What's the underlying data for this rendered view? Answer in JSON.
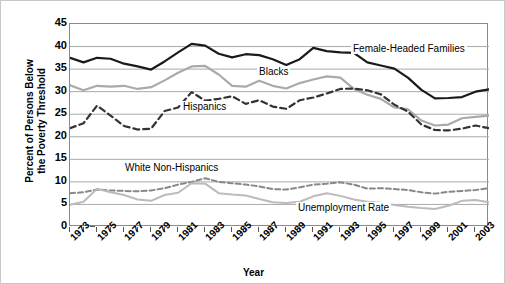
{
  "chart": {
    "type": "line",
    "ylabel_line1": "Percent of Persons Below",
    "ylabel_line2": "the Poverty Threshold",
    "xlabel": "Year"
  },
  "axes": {
    "yticks": [
      "45",
      "40",
      "35",
      "30",
      "25",
      "20",
      "15",
      "10",
      "5",
      "0"
    ],
    "xticks": [
      "1973",
      "1975",
      "1977",
      "1979",
      "1981",
      "1983",
      "1985",
      "1987",
      "1989",
      "1991",
      "1993",
      "1995",
      "1997",
      "1999",
      "2001",
      "2003"
    ]
  },
  "annotations": {
    "female_headed": "Female-Headed Families",
    "blacks": "Blacks",
    "hispanics": "Hispanics",
    "white_non_hispanics": "White Non-Hispanics",
    "unemployment": "Unemployment Rate"
  },
  "colors": {
    "female_headed": "#1a1a1a",
    "blacks": "#aaaaaa",
    "hispanics": "#333333",
    "white_non_hispanics": "#888888",
    "unemployment": "#bbbbbb",
    "grid": "#a9a9a9",
    "frame": "#8a8a8a"
  },
  "chart_data": {
    "type": "line",
    "title": "",
    "xlabel": "Year",
    "ylabel": "Percent of Persons Below the Poverty Threshold",
    "xlim": [
      1973,
      2004
    ],
    "ylim": [
      0,
      45
    ],
    "grid": true,
    "legend": "inline-annotations",
    "x": [
      1973,
      1974,
      1975,
      1976,
      1977,
      1978,
      1979,
      1980,
      1981,
      1982,
      1983,
      1984,
      1985,
      1986,
      1987,
      1988,
      1989,
      1990,
      1991,
      1992,
      1993,
      1994,
      1995,
      1996,
      1997,
      1998,
      1999,
      2000,
      2001,
      2002,
      2003,
      2004
    ],
    "series": [
      {
        "name": "Female-Headed Families",
        "style": "solid-dark",
        "values": [
          37.5,
          36.5,
          37.5,
          37.3,
          36.2,
          35.6,
          34.9,
          36.7,
          38.7,
          40.6,
          40.2,
          38.4,
          37.6,
          38.3,
          38.1,
          37.2,
          35.9,
          37.2,
          39.7,
          39.0,
          38.7,
          38.6,
          36.5,
          35.8,
          35.1,
          33.1,
          30.4,
          28.5,
          28.6,
          28.8,
          30.0,
          30.5
        ]
      },
      {
        "name": "Blacks",
        "style": "solid-light-gray",
        "values": [
          31.4,
          30.3,
          31.3,
          31.1,
          31.3,
          30.6,
          31.0,
          32.5,
          34.2,
          35.6,
          35.7,
          33.8,
          31.3,
          31.1,
          32.4,
          31.3,
          30.7,
          31.9,
          32.7,
          33.4,
          33.1,
          30.6,
          29.3,
          28.4,
          26.5,
          26.1,
          23.6,
          22.5,
          22.7,
          24.1,
          24.4,
          24.7
        ]
      },
      {
        "name": "Hispanics",
        "style": "dashed-dark",
        "values": [
          21.9,
          23.0,
          26.9,
          24.7,
          22.4,
          21.6,
          21.8,
          25.7,
          26.5,
          29.9,
          28.0,
          28.4,
          29.0,
          27.3,
          28.1,
          26.7,
          26.2,
          28.1,
          28.7,
          29.6,
          30.6,
          30.7,
          30.3,
          29.4,
          27.1,
          25.6,
          22.7,
          21.5,
          21.4,
          21.8,
          22.5,
          21.9
        ]
      },
      {
        "name": "White Non-Hispanics",
        "style": "dashed-gray",
        "values": [
          7.5,
          7.7,
          8.3,
          8.1,
          8.0,
          7.9,
          8.1,
          8.6,
          9.4,
          10.0,
          10.8,
          10.0,
          9.7,
          9.4,
          9.0,
          8.4,
          8.3,
          8.8,
          9.4,
          9.6,
          9.9,
          9.4,
          8.5,
          8.6,
          8.4,
          8.2,
          7.7,
          7.4,
          7.8,
          8.0,
          8.2,
          8.6
        ]
      },
      {
        "name": "Unemployment Rate",
        "style": "solid-pale-gray",
        "values": [
          4.9,
          5.6,
          8.5,
          7.7,
          7.1,
          6.1,
          5.8,
          7.1,
          7.6,
          9.7,
          9.6,
          7.5,
          7.2,
          7.0,
          6.2,
          5.5,
          5.3,
          5.6,
          6.8,
          7.5,
          6.9,
          6.1,
          5.6,
          5.4,
          4.9,
          4.5,
          4.2,
          4.0,
          4.7,
          5.8,
          6.0,
          5.5
        ]
      }
    ]
  }
}
